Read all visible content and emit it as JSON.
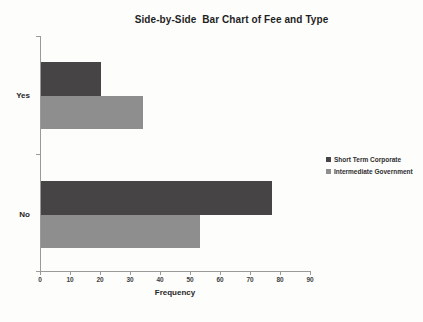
{
  "chart_data": {
    "type": "bar",
    "orientation": "horizontal",
    "title": "Side-by-Side  Bar Chart of Fee and Type",
    "xlabel": "Frequency",
    "ylabel": "",
    "categories": [
      "Yes",
      "No"
    ],
    "series": [
      {
        "name": "Short Term Corporate",
        "color": "#474445",
        "values": [
          20,
          77
        ]
      },
      {
        "name": "Intermediate Government",
        "color": "#8e8e8e",
        "values": [
          34,
          53
        ]
      }
    ],
    "xlim": [
      0,
      90
    ],
    "xticks": [
      0,
      10,
      20,
      30,
      40,
      50,
      60,
      70,
      80,
      90
    ],
    "grid": false,
    "legend_position": "right",
    "axis_color": "#9a9a9a"
  }
}
